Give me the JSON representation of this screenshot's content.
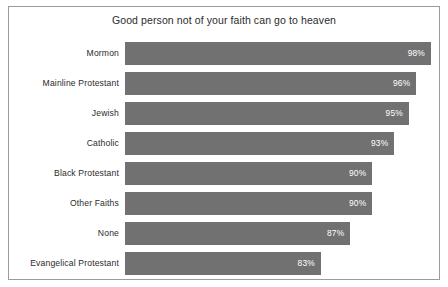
{
  "chart_data": {
    "type": "bar",
    "orientation": "horizontal",
    "title": "Good person not of your faith can go to heaven",
    "subtitle": "",
    "xlabel": "",
    "ylabel": "",
    "grid": false,
    "legend": null,
    "legend_position": "none",
    "value_suffix": "%",
    "axis_min": 0,
    "axis_max": 100,
    "bar_color": "#717171",
    "value_label_color": "#ffffff",
    "categories": [
      "Mormon",
      "Mainline Protestant",
      "Jewish",
      "Catholic",
      "Black Protestant",
      "Other Faiths",
      "None",
      "Evangelical Protestant"
    ],
    "values": [
      98,
      96,
      95,
      93,
      90,
      90,
      87,
      83
    ],
    "value_labels": [
      "98%",
      "96%",
      "95%",
      "93%",
      "90%",
      "90%",
      "87%",
      "83%"
    ],
    "bars": [
      {
        "category": "Mormon",
        "value": 98,
        "label": "98%",
        "bar_fraction": 1.0
      },
      {
        "category": "Mainline Protestant",
        "value": 96,
        "label": "96%",
        "bar_fraction": 0.9521
      },
      {
        "category": "Jewish",
        "value": 95,
        "label": "95%",
        "bar_fraction": 0.9281
      },
      {
        "category": "Catholic",
        "value": 93,
        "label": "93%",
        "bar_fraction": 0.8802
      },
      {
        "category": "Black Protestant",
        "value": 90,
        "label": "90%",
        "bar_fraction": 0.8082
      },
      {
        "category": "Other Faiths",
        "value": 90,
        "label": "90%",
        "bar_fraction": 0.8082
      },
      {
        "category": "None",
        "value": 87,
        "label": "87%",
        "bar_fraction": 0.7363
      },
      {
        "category": "Evangelical Protestant",
        "value": 83,
        "label": "83%",
        "bar_fraction": 0.6404
      }
    ]
  }
}
